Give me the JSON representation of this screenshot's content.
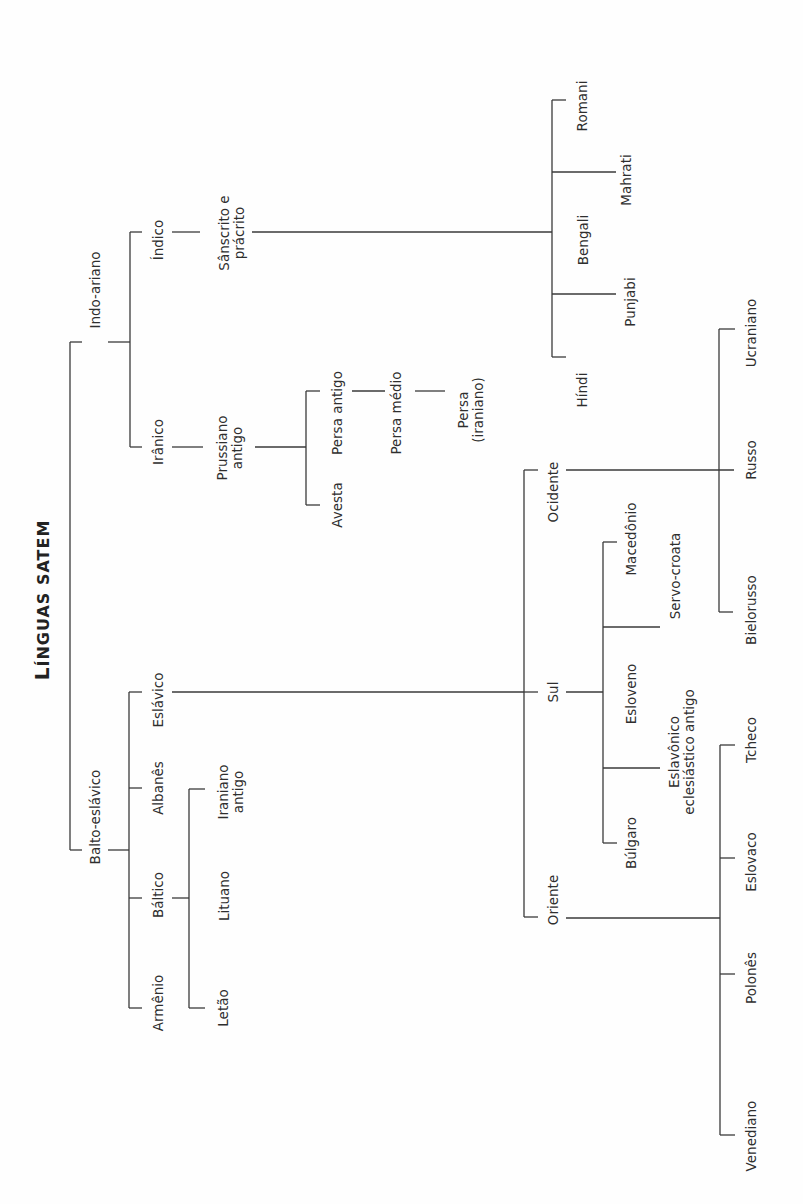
{
  "title": {
    "text": "LÍNGUAS SATEM",
    "big_initial": "L",
    "rest": "ÍNGUAS SATEM",
    "x": 43,
    "y": 600
  },
  "labels": [
    {
      "id": "indo-ariano",
      "text": "Indo-ariano",
      "x": 95,
      "y": 290
    },
    {
      "id": "indico",
      "text": "Índico",
      "x": 158,
      "y": 240
    },
    {
      "id": "sanscrito-e-pracrito",
      "text": "Sânscrito e\nprácrito",
      "x": 232,
      "y": 233
    },
    {
      "id": "romani",
      "text": "Romani",
      "x": 582,
      "y": 106
    },
    {
      "id": "mahrati",
      "text": "Mahrati",
      "x": 626,
      "y": 180
    },
    {
      "id": "bengali",
      "text": "Bengali",
      "x": 583,
      "y": 240
    },
    {
      "id": "punjabi",
      "text": "Punjabi",
      "x": 630,
      "y": 302
    },
    {
      "id": "hindi",
      "text": "Híndi",
      "x": 582,
      "y": 390
    },
    {
      "id": "iranico",
      "text": "Irânico",
      "x": 158,
      "y": 442
    },
    {
      "id": "prussiano-antigo",
      "text": "Prussiano\nantigo",
      "x": 230,
      "y": 448
    },
    {
      "id": "persa-antigo",
      "text": "Persa antigo",
      "x": 337,
      "y": 413
    },
    {
      "id": "avesta",
      "text": "Avesta",
      "x": 337,
      "y": 505
    },
    {
      "id": "persa-medio",
      "text": "Persa médio",
      "x": 396,
      "y": 413
    },
    {
      "id": "persa-iraniano",
      "text": "Persa\n(iraniano)",
      "x": 471,
      "y": 410
    },
    {
      "id": "balto-eslavico",
      "text": "Balto-eslávico",
      "x": 95,
      "y": 817
    },
    {
      "id": "eslavico",
      "text": "Eslávico",
      "x": 158,
      "y": 700
    },
    {
      "id": "albanes",
      "text": "Albanês",
      "x": 158,
      "y": 788
    },
    {
      "id": "baltico",
      "text": "Báltico",
      "x": 158,
      "y": 895
    },
    {
      "id": "armenio",
      "text": "Armênio",
      "x": 158,
      "y": 1003
    },
    {
      "id": "iraniano-antigo",
      "text": "Iraniano\nantigo",
      "x": 231,
      "y": 792
    },
    {
      "id": "lituano",
      "text": "Lituano",
      "x": 224,
      "y": 896
    },
    {
      "id": "letao",
      "text": "Letão",
      "x": 223,
      "y": 1008
    },
    {
      "id": "ocidente",
      "text": "Ocidente",
      "x": 553,
      "y": 492
    },
    {
      "id": "sul",
      "text": "Sul",
      "x": 553,
      "y": 692
    },
    {
      "id": "oriente",
      "text": "Oriente",
      "x": 553,
      "y": 900
    },
    {
      "id": "macedonio",
      "text": "Macedônio",
      "x": 631,
      "y": 539
    },
    {
      "id": "servo-croata",
      "text": "Servo-croata",
      "x": 675,
      "y": 576
    },
    {
      "id": "esloveno",
      "text": "Esloveno",
      "x": 631,
      "y": 694
    },
    {
      "id": "eslavonico-eclesiastico-antigo",
      "text": "Eslavônico\neclesiástico antigo",
      "x": 682,
      "y": 752
    },
    {
      "id": "bulgaro",
      "text": "Búlgaro",
      "x": 631,
      "y": 843
    },
    {
      "id": "ucraniano",
      "text": "Ucraniano",
      "x": 751,
      "y": 333
    },
    {
      "id": "russo",
      "text": "Russo",
      "x": 751,
      "y": 460
    },
    {
      "id": "bielorusso",
      "text": "Bielorusso",
      "x": 751,
      "y": 610
    },
    {
      "id": "tcheco",
      "text": "Tcheco",
      "x": 751,
      "y": 740
    },
    {
      "id": "eslovaco",
      "text": "Eslovaco",
      "x": 751,
      "y": 862
    },
    {
      "id": "polones",
      "text": "Polonês",
      "x": 751,
      "y": 978
    },
    {
      "id": "venediano",
      "text": "Venediano",
      "x": 751,
      "y": 1136
    }
  ],
  "edges": [
    [
      70,
      342,
      70,
      850
    ],
    [
      70,
      342,
      82,
      342
    ],
    [
      108,
      342,
      130,
      342
    ],
    [
      70,
      850,
      82,
      850
    ],
    [
      108,
      850,
      129,
      850
    ],
    [
      130,
      232,
      130,
      447
    ],
    [
      130,
      232,
      142,
      232
    ],
    [
      172,
      232,
      200,
      232
    ],
    [
      252,
      232,
      552,
      232
    ],
    [
      552,
      100,
      552,
      357
    ],
    [
      552,
      100,
      566,
      100
    ],
    [
      552,
      172,
      616,
      172
    ],
    [
      552,
      294,
      616,
      294
    ],
    [
      552,
      357,
      566,
      357
    ],
    [
      130,
      447,
      142,
      447
    ],
    [
      172,
      447,
      203,
      447
    ],
    [
      255,
      447,
      306,
      447
    ],
    [
      306,
      391,
      306,
      505
    ],
    [
      306,
      391,
      320,
      391
    ],
    [
      352,
      391,
      385,
      391
    ],
    [
      415,
      391,
      445,
      391
    ],
    [
      306,
      505,
      320,
      505
    ],
    [
      129,
      692,
      129,
      1008
    ],
    [
      129,
      692,
      142,
      692
    ],
    [
      172,
      692,
      524,
      692
    ],
    [
      129,
      788,
      142,
      788
    ],
    [
      129,
      898,
      142,
      898
    ],
    [
      172,
      898,
      189,
      898
    ],
    [
      129,
      1008,
      142,
      1008
    ],
    [
      189,
      789,
      189,
      1008
    ],
    [
      189,
      789,
      205,
      789
    ],
    [
      189,
      1008,
      205,
      1008
    ],
    [
      524,
      470,
      524,
      917
    ],
    [
      524,
      470,
      538,
      470
    ],
    [
      566,
      470,
      734,
      470
    ],
    [
      538,
      692,
      538,
      692
    ],
    [
      524,
      692,
      538,
      692
    ],
    [
      566,
      692,
      603,
      692
    ],
    [
      524,
      917,
      538,
      917
    ],
    [
      566,
      918,
      720,
      918
    ],
    [
      603,
      542,
      603,
      843
    ],
    [
      603,
      542,
      617,
      542
    ],
    [
      603,
      627,
      660,
      627
    ],
    [
      603,
      768,
      660,
      768
    ],
    [
      603,
      843,
      617,
      843
    ],
    [
      719,
      329,
      719,
      612
    ],
    [
      719,
      329,
      735,
      329
    ],
    [
      719,
      612,
      733,
      612
    ],
    [
      720,
      745,
      720,
      1135
    ],
    [
      720,
      745,
      735,
      745
    ],
    [
      720,
      858,
      735,
      858
    ],
    [
      720,
      974,
      735,
      974
    ],
    [
      720,
      1135,
      735,
      1135
    ]
  ],
  "colors": {
    "line": "#3a3a3a",
    "text": "#2e2e2e",
    "background": "#fefefe"
  }
}
